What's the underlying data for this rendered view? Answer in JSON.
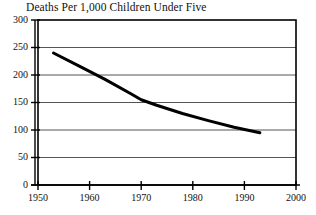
{
  "chart_data": {
    "type": "line",
    "title": "Deaths Per 1,000 Children Under Five",
    "annotation": "Source: UN",
    "xlabel": "",
    "ylabel": "",
    "xlim": [
      1950,
      2000
    ],
    "ylim": [
      0,
      300
    ],
    "grid": true,
    "legend": "none",
    "x_ticks": [
      1950,
      1960,
      1970,
      1980,
      1990,
      2000
    ],
    "x_tick_labels": [
      "1950",
      "1960",
      "1970",
      "1980",
      "1990",
      "2000"
    ],
    "y_ticks": [
      0,
      50,
      100,
      150,
      200,
      250,
      300
    ],
    "y_tick_labels": [
      "0",
      "50",
      "100",
      "150",
      "200",
      "250",
      "300"
    ],
    "series": [
      {
        "name": "Deaths per 1,000 children under five",
        "color": "#000000",
        "x": [
          1953,
          1958,
          1963,
          1968,
          1970,
          1973,
          1978,
          1983,
          1988,
          1993
        ],
        "values": [
          240,
          216,
          192,
          166,
          155,
          145,
          130,
          117,
          105,
          95
        ]
      }
    ]
  },
  "colors": {
    "line": "#000000",
    "grid": "#555555",
    "frame": "#000000",
    "background": "#ffffff"
  }
}
